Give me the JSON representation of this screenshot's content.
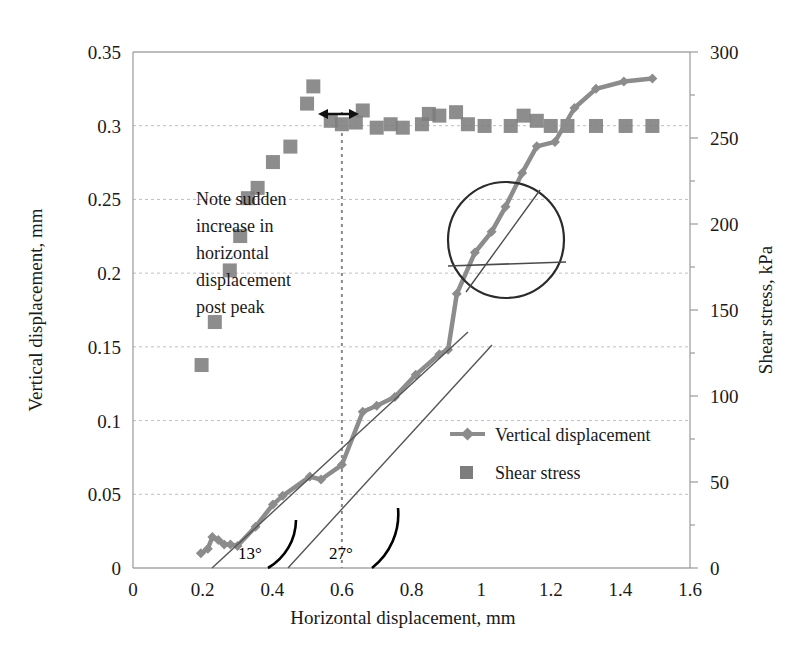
{
  "chart_data": {
    "type": "scatter",
    "title": "",
    "xlabel": "Horizontal displacement, mm",
    "ylabel": "Vertical displacement, mm",
    "y2label": "Shear stress, kPa",
    "xlim": [
      0,
      1.6
    ],
    "ylim": [
      0,
      0.35
    ],
    "y2lim": [
      0,
      300
    ],
    "grid": true,
    "legend_position": "center-right",
    "xticks": [
      "0",
      "0.2",
      "0.4",
      "0.6",
      "0.8",
      "1",
      "1.2",
      "1.4",
      "1.6"
    ],
    "xtick_values": [
      0,
      0.2,
      0.4,
      0.6,
      0.8,
      1.0,
      1.2,
      1.4,
      1.6
    ],
    "yticks": [
      "0",
      "0.05",
      "0.1",
      "0.15",
      "0.2",
      "0.25",
      "0.3",
      "0.35"
    ],
    "ytick_values": [
      0,
      0.05,
      0.1,
      0.15,
      0.2,
      0.25,
      0.3,
      0.35
    ],
    "y2ticks": [
      "0",
      "50",
      "100",
      "150",
      "200",
      "250",
      "300"
    ],
    "y2tick_values": [
      0,
      50,
      100,
      150,
      200,
      250,
      300
    ],
    "series": [
      {
        "name": "Vertical displacement",
        "marker": "diamond",
        "style": "line-markers",
        "color": "#8c8c8c",
        "axis": "left",
        "points": [
          [
            0.195,
            0.01
          ],
          [
            0.215,
            0.013
          ],
          [
            0.228,
            0.021
          ],
          [
            0.245,
            0.019
          ],
          [
            0.262,
            0.016
          ],
          [
            0.28,
            0.016
          ],
          [
            0.3,
            0.015
          ],
          [
            0.352,
            0.028
          ],
          [
            0.402,
            0.043
          ],
          [
            0.43,
            0.049
          ],
          [
            0.508,
            0.062
          ],
          [
            0.54,
            0.06
          ],
          [
            0.6,
            0.07
          ],
          [
            0.66,
            0.106
          ],
          [
            0.7,
            0.11
          ],
          [
            0.752,
            0.116
          ],
          [
            0.812,
            0.131
          ],
          [
            0.88,
            0.145
          ],
          [
            0.905,
            0.148
          ],
          [
            0.93,
            0.186
          ],
          [
            0.982,
            0.214
          ],
          [
            1.03,
            0.228
          ],
          [
            1.07,
            0.245
          ],
          [
            1.118,
            0.268
          ],
          [
            1.16,
            0.286
          ],
          [
            1.212,
            0.289
          ],
          [
            1.268,
            0.312
          ],
          [
            1.33,
            0.325
          ],
          [
            1.41,
            0.33
          ],
          [
            1.492,
            0.332
          ]
        ]
      },
      {
        "name": "Shear stress",
        "marker": "square",
        "style": "markers",
        "color": "#7d7d7d",
        "axis": "right",
        "points": [
          [
            0.197,
            118
          ],
          [
            0.235,
            143
          ],
          [
            0.278,
            173
          ],
          [
            0.308,
            193
          ],
          [
            0.33,
            215
          ],
          [
            0.358,
            221
          ],
          [
            0.402,
            236
          ],
          [
            0.452,
            245
          ],
          [
            0.5,
            270
          ],
          [
            0.518,
            280
          ],
          [
            0.568,
            260
          ],
          [
            0.6,
            258
          ],
          [
            0.64,
            259
          ],
          [
            0.66,
            266
          ],
          [
            0.7,
            256
          ],
          [
            0.74,
            258
          ],
          [
            0.775,
            256
          ],
          [
            0.83,
            258
          ],
          [
            0.85,
            264
          ],
          [
            0.88,
            263
          ],
          [
            0.928,
            265
          ],
          [
            0.962,
            258
          ],
          [
            1.01,
            257
          ],
          [
            1.085,
            257
          ],
          [
            1.122,
            263
          ],
          [
            1.16,
            260
          ],
          [
            1.2,
            257
          ],
          [
            1.248,
            257
          ],
          [
            1.33,
            257
          ],
          [
            1.415,
            257
          ],
          [
            1.492,
            257
          ]
        ]
      }
    ],
    "annotations": [
      {
        "name": "note-text",
        "lines": [
          "Note sudden",
          "increase in",
          "horizontal",
          "displacement",
          "post peak"
        ],
        "x": 0.62,
        "y": 0.245
      },
      {
        "name": "angle-13",
        "label": "13°"
      },
      {
        "name": "angle-27",
        "label": "27°"
      },
      {
        "name": "peak-marker-line",
        "x": 0.6
      },
      {
        "name": "sudden-increase-arrow"
      },
      {
        "name": "detail-circle"
      }
    ]
  },
  "legend": {
    "entries": [
      {
        "label": "Vertical displacement",
        "marker": "diamond-line"
      },
      {
        "label": "Shear stress",
        "marker": "square"
      }
    ]
  },
  "colors": {
    "series1": "#8c8c8c",
    "series2": "#7d7d7d",
    "grid": "#bfbfbf",
    "axis": "#999999",
    "text": "#1a1a1a",
    "annotation_stroke": "#000000"
  }
}
